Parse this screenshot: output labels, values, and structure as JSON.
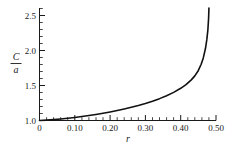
{
  "chart_data": {
    "type": "line",
    "title": "",
    "xlabel": "r",
    "ylabel": "C/a",
    "ylabel_numerator": "C",
    "ylabel_denominator": "a",
    "xlim": [
      0,
      0.5
    ],
    "ylim": [
      1.0,
      2.6
    ],
    "grid": false,
    "legend": null,
    "x_ticks": [
      0,
      0.1,
      0.2,
      0.3,
      0.4,
      0.5
    ],
    "x_tick_labels": [
      "0",
      "0.10",
      "0.20",
      "0.30",
      "0.40",
      "0.50"
    ],
    "x_minor_step": 0.02,
    "y_ticks": [
      1.0,
      1.5,
      2.0,
      2.5
    ],
    "y_tick_labels": [
      "1.0",
      "1.5",
      "2.0",
      "2.5"
    ],
    "y_minor_step": 0.1,
    "series": [
      {
        "name": "C/a",
        "x": [
          0.0,
          0.02,
          0.04,
          0.06,
          0.08,
          0.1,
          0.12,
          0.14,
          0.16,
          0.18,
          0.2,
          0.22,
          0.24,
          0.26,
          0.28,
          0.3,
          0.32,
          0.34,
          0.36,
          0.38,
          0.4,
          0.415,
          0.43,
          0.44,
          0.45,
          0.458,
          0.464,
          0.47,
          0.474,
          0.477,
          0.479,
          0.48
        ],
        "values": [
          1.0,
          1.005,
          1.012,
          1.021,
          1.031,
          1.043,
          1.056,
          1.07,
          1.086,
          1.103,
          1.122,
          1.142,
          1.164,
          1.188,
          1.214,
          1.243,
          1.275,
          1.311,
          1.352,
          1.4,
          1.458,
          1.51,
          1.578,
          1.635,
          1.712,
          1.8,
          1.89,
          2.02,
          2.15,
          2.29,
          2.45,
          2.6
        ]
      }
    ]
  },
  "axis": {
    "x_name": "r",
    "y_name_numerator": "C",
    "y_name_denominator": "a"
  }
}
